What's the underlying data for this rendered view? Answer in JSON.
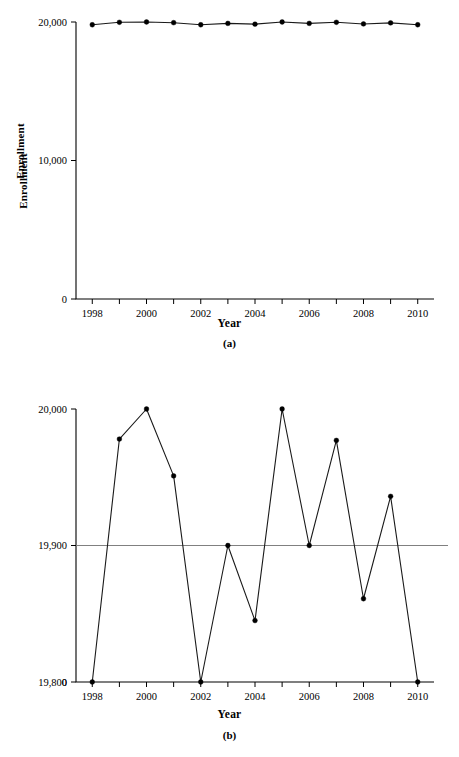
{
  "chart_data": [
    {
      "id": "panel-a",
      "type": "line",
      "panel_label": "(a)",
      "title": "",
      "xlabel": "Year",
      "ylabel": "Enrollment",
      "x": [
        1998,
        1999,
        2000,
        2001,
        2002,
        2003,
        2004,
        2005,
        2006,
        2007,
        2008,
        2009,
        2010
      ],
      "values": [
        19800,
        19978,
        20000,
        19951,
        19800,
        19900,
        19845,
        20000,
        19900,
        19977,
        19861,
        19936,
        19800
      ],
      "series": [
        {
          "name": "Enrollment",
          "values": [
            19800,
            19978,
            20000,
            19951,
            19800,
            19900,
            19845,
            20000,
            19900,
            19977,
            19861,
            19936,
            19800
          ]
        }
      ],
      "xlim": [
        1997.4,
        2010.6
      ],
      "ylim": [
        0,
        20000
      ],
      "xticks": [
        1998,
        1999,
        2000,
        2001,
        2002,
        2003,
        2004,
        2005,
        2006,
        2007,
        2008,
        2009,
        2010
      ],
      "xticklabels": [
        "1998",
        "",
        "2000",
        "",
        "2002",
        "",
        "2004",
        "",
        "2006",
        "",
        "2008",
        "",
        "2010"
      ],
      "yticks": [
        0,
        10000,
        20000
      ],
      "yticklabels": [
        "0",
        "10,000",
        "20,000"
      ],
      "grid": false,
      "reference_line": null,
      "legend": null,
      "marker": "filled-circle"
    },
    {
      "id": "panel-b",
      "type": "line",
      "panel_label": "(b)",
      "title": "",
      "xlabel": "Year",
      "ylabel": "Enrollment",
      "x": [
        1998,
        1999,
        2000,
        2001,
        2002,
        2003,
        2004,
        2005,
        2006,
        2007,
        2008,
        2009,
        2010
      ],
      "values": [
        19800,
        19978,
        20000,
        19951,
        19800,
        19900,
        19845,
        20000,
        19900,
        19977,
        19861,
        19936,
        19800
      ],
      "series": [
        {
          "name": "Enrollment",
          "values": [
            19800,
            19978,
            20000,
            19951,
            19800,
            19900,
            19845,
            20000,
            19900,
            19977,
            19861,
            19936,
            19800
          ]
        }
      ],
      "xlim": [
        1997.4,
        2010.6
      ],
      "ylim": [
        19800,
        20000
      ],
      "xticks": [
        1998,
        1999,
        2000,
        2001,
        2002,
        2003,
        2004,
        2005,
        2006,
        2007,
        2008,
        2009,
        2010
      ],
      "xticklabels": [
        "1998",
        "",
        "2000",
        "",
        "2002",
        "",
        "2004",
        "",
        "2006",
        "",
        "2008",
        "",
        "2010"
      ],
      "yticks": [
        19800,
        19900,
        20000
      ],
      "yticklabels": [
        "19,800",
        "19,900",
        "20,000"
      ],
      "y_origin_label": "0",
      "grid": false,
      "reference_line": {
        "value": 19900,
        "color": "#808080",
        "orientation": "horizontal"
      },
      "legend": null,
      "marker": "filled-circle"
    }
  ],
  "colors": {
    "axis": "#000000",
    "line": "#1a1a1a",
    "marker": "#000000",
    "reference": "#808080",
    "background": "#ffffff"
  }
}
